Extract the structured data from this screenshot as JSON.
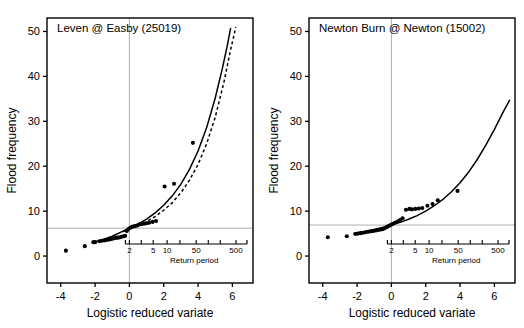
{
  "figure": {
    "panel_count": 2,
    "background": "#ffffff",
    "foreground": "#000000",
    "guide_color": "#999999"
  },
  "chart_data": [
    {
      "type": "scatter",
      "title": "Leven @ Easby (25019)",
      "xlabel": "Logistic reduced variate",
      "ylabel": "Flood frequency",
      "xlim": [
        -4.8,
        7.2
      ],
      "ylim": [
        -6,
        53
      ],
      "xticks": [
        -4,
        -2,
        0,
        2,
        4,
        6
      ],
      "xticklabels": [
        "-4",
        "-2",
        "0",
        "2",
        "4",
        "6"
      ],
      "yticks": [
        0,
        10,
        20,
        30,
        40,
        50
      ],
      "yticklabels": [
        "0",
        "10",
        "20",
        "30",
        "40",
        "50"
      ],
      "grid": false,
      "legend": "none",
      "secondary_axis": {
        "label": "Return period",
        "ticks": [
          2,
          5,
          10,
          50,
          500
        ],
        "ticklabels": [
          "2",
          "5",
          "10",
          "50",
          "500"
        ],
        "minor_ticks": [
          3,
          20,
          100,
          200
        ],
        "scale": "logistic-reduced-variate"
      },
      "reference_lines": [
        {
          "orientation": "vertical",
          "value": 0,
          "style": "solid",
          "color": "#999999"
        },
        {
          "orientation": "horizontal",
          "value": 6.2,
          "style": "solid",
          "color": "#999999"
        }
      ],
      "series": [
        {
          "name": "fitted curve (solid)",
          "style": "solid",
          "x": [
            -2.2,
            -1.6,
            -1.0,
            -0.4,
            0.0,
            0.5,
            1.0,
            1.5,
            2.0,
            2.5,
            3.0,
            3.5,
            4.0,
            4.5,
            5.0,
            5.4,
            5.7,
            5.9
          ],
          "y": [
            3.0,
            3.6,
            4.4,
            5.5,
            6.2,
            7.1,
            8.2,
            9.6,
            11.3,
            13.4,
            16.0,
            19.3,
            23.4,
            28.6,
            35.2,
            41.5,
            46.8,
            50.8
          ]
        },
        {
          "name": "confidence/alternative curve (dashed)",
          "style": "dashed",
          "x": [
            -0.4,
            0.0,
            0.5,
            1.0,
            1.5,
            2.0,
            2.5,
            3.0,
            3.5,
            4.0,
            4.5,
            5.0,
            5.5,
            5.9,
            6.2
          ],
          "y": [
            5.4,
            6.1,
            6.8,
            7.7,
            8.8,
            10.2,
            11.9,
            14.1,
            16.9,
            20.4,
            25.0,
            30.9,
            38.6,
            46.0,
            51.0
          ]
        },
        {
          "name": "observed annual maxima",
          "style": "points",
          "x": [
            -3.7,
            -2.6,
            -2.1,
            -2.0,
            -1.75,
            -1.6,
            -1.45,
            -1.3,
            -1.15,
            -1.05,
            -0.95,
            -0.85,
            -0.75,
            -0.65,
            -0.55,
            -0.45,
            -0.35,
            -0.25,
            -0.15,
            -0.05,
            0.05,
            0.15,
            0.25,
            0.35,
            0.45,
            0.55,
            0.7,
            0.85,
            1.0,
            1.15,
            1.35,
            1.55,
            2.05,
            2.6,
            3.7
          ],
          "y": [
            1.2,
            2.2,
            3.1,
            3.1,
            3.3,
            3.4,
            3.5,
            3.6,
            3.7,
            3.8,
            3.9,
            4.0,
            4.1,
            4.1,
            4.2,
            4.3,
            4.4,
            4.5,
            5.6,
            6.0,
            6.3,
            6.5,
            6.6,
            6.7,
            6.8,
            7.0,
            7.1,
            7.2,
            7.3,
            7.4,
            7.6,
            7.8,
            15.5,
            16.1,
            25.2
          ]
        }
      ]
    },
    {
      "type": "scatter",
      "title": "Newton Burn @ Newton (15002)",
      "xlabel": "Logistic reduced variate",
      "ylabel": "Flood frequency",
      "xlim": [
        -4.8,
        7.2
      ],
      "ylim": [
        -6,
        53
      ],
      "xticks": [
        -4,
        -2,
        0,
        2,
        4,
        6
      ],
      "xticklabels": [
        "-4",
        "-2",
        "0",
        "2",
        "4",
        "6"
      ],
      "yticks": [
        0,
        10,
        20,
        30,
        40,
        50
      ],
      "yticklabels": [
        "0",
        "10",
        "20",
        "30",
        "40",
        "50"
      ],
      "grid": false,
      "legend": "none",
      "secondary_axis": {
        "label": "Return period",
        "ticks": [
          2,
          5,
          10,
          50,
          500
        ],
        "ticklabels": [
          "2",
          "5",
          "10",
          "50",
          "500"
        ],
        "minor_ticks": [
          3,
          20,
          100,
          200
        ],
        "scale": "logistic-reduced-variate"
      },
      "reference_lines": [
        {
          "orientation": "vertical",
          "value": 0,
          "style": "solid",
          "color": "#999999"
        },
        {
          "orientation": "horizontal",
          "value": 6.9,
          "style": "solid",
          "color": "#999999"
        }
      ],
      "series": [
        {
          "name": "fitted curve (solid)",
          "style": "solid",
          "x": [
            -2.2,
            -1.6,
            -1.0,
            -0.4,
            0.0,
            0.5,
            1.0,
            1.5,
            2.0,
            2.5,
            3.0,
            3.5,
            4.0,
            4.5,
            5.0,
            5.5,
            6.0,
            6.5,
            6.9
          ],
          "y": [
            5.0,
            5.4,
            5.9,
            6.5,
            6.9,
            7.5,
            8.2,
            9.0,
            10.0,
            11.2,
            12.6,
            14.3,
            16.3,
            18.7,
            21.5,
            24.7,
            28.2,
            32.0,
            34.8
          ]
        },
        {
          "name": "observed annual maxima",
          "style": "points",
          "x": [
            -3.7,
            -2.6,
            -2.1,
            -1.95,
            -1.8,
            -1.65,
            -1.5,
            -1.35,
            -1.2,
            -1.05,
            -0.9,
            -0.75,
            -0.6,
            -0.5,
            -0.4,
            -0.3,
            -0.2,
            -0.1,
            0.0,
            0.1,
            0.2,
            0.35,
            0.5,
            0.65,
            0.85,
            1.05,
            1.2,
            1.4,
            1.6,
            1.8,
            2.1,
            2.4,
            2.7,
            3.85
          ],
          "y": [
            4.2,
            4.4,
            4.9,
            5.0,
            5.1,
            5.2,
            5.3,
            5.4,
            5.5,
            5.6,
            5.7,
            5.8,
            5.9,
            6.0,
            6.2,
            6.4,
            6.6,
            6.8,
            7.0,
            7.2,
            7.4,
            7.7,
            8.0,
            8.4,
            10.3,
            10.5,
            10.4,
            10.5,
            10.6,
            10.7,
            11.2,
            11.6,
            12.4,
            14.5
          ]
        }
      ]
    }
  ]
}
